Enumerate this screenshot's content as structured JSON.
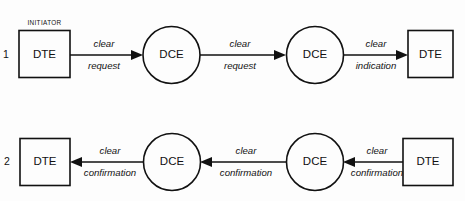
{
  "diagram": {
    "background_color": "#fdfdfd",
    "line_color": "#111111",
    "annotations": {
      "initiator": "INITIATOR"
    },
    "rows": [
      {
        "number": "1",
        "direction": "left-to-right",
        "nodes": [
          {
            "id": "r1-dte-left",
            "label": "DTE",
            "shape": "rect"
          },
          {
            "id": "r1-dce-1",
            "label": "DCE",
            "shape": "circle"
          },
          {
            "id": "r1-dce-2",
            "label": "DCE",
            "shape": "circle"
          },
          {
            "id": "r1-dte-right",
            "label": "DTE",
            "shape": "rect"
          }
        ],
        "edges": [
          {
            "id": "r1-edge-1",
            "line1": "clear",
            "line2": "request"
          },
          {
            "id": "r1-edge-2",
            "line1": "clear",
            "line2": "request"
          },
          {
            "id": "r1-edge-3",
            "line1": "clear",
            "line2": "indication"
          }
        ]
      },
      {
        "number": "2",
        "direction": "right-to-left",
        "nodes": [
          {
            "id": "r2-dte-left",
            "label": "DTE",
            "shape": "rect"
          },
          {
            "id": "r2-dce-1",
            "label": "DCE",
            "shape": "circle"
          },
          {
            "id": "r2-dce-2",
            "label": "DCE",
            "shape": "circle"
          },
          {
            "id": "r2-dte-right",
            "label": "DTE",
            "shape": "rect"
          }
        ],
        "edges": [
          {
            "id": "r2-edge-1",
            "line1": "clear",
            "line2": "confirmation"
          },
          {
            "id": "r2-edge-2",
            "line1": "clear",
            "line2": "confirmation"
          },
          {
            "id": "r2-edge-3",
            "line1": "clear",
            "line2": "confirmation"
          }
        ]
      }
    ]
  }
}
